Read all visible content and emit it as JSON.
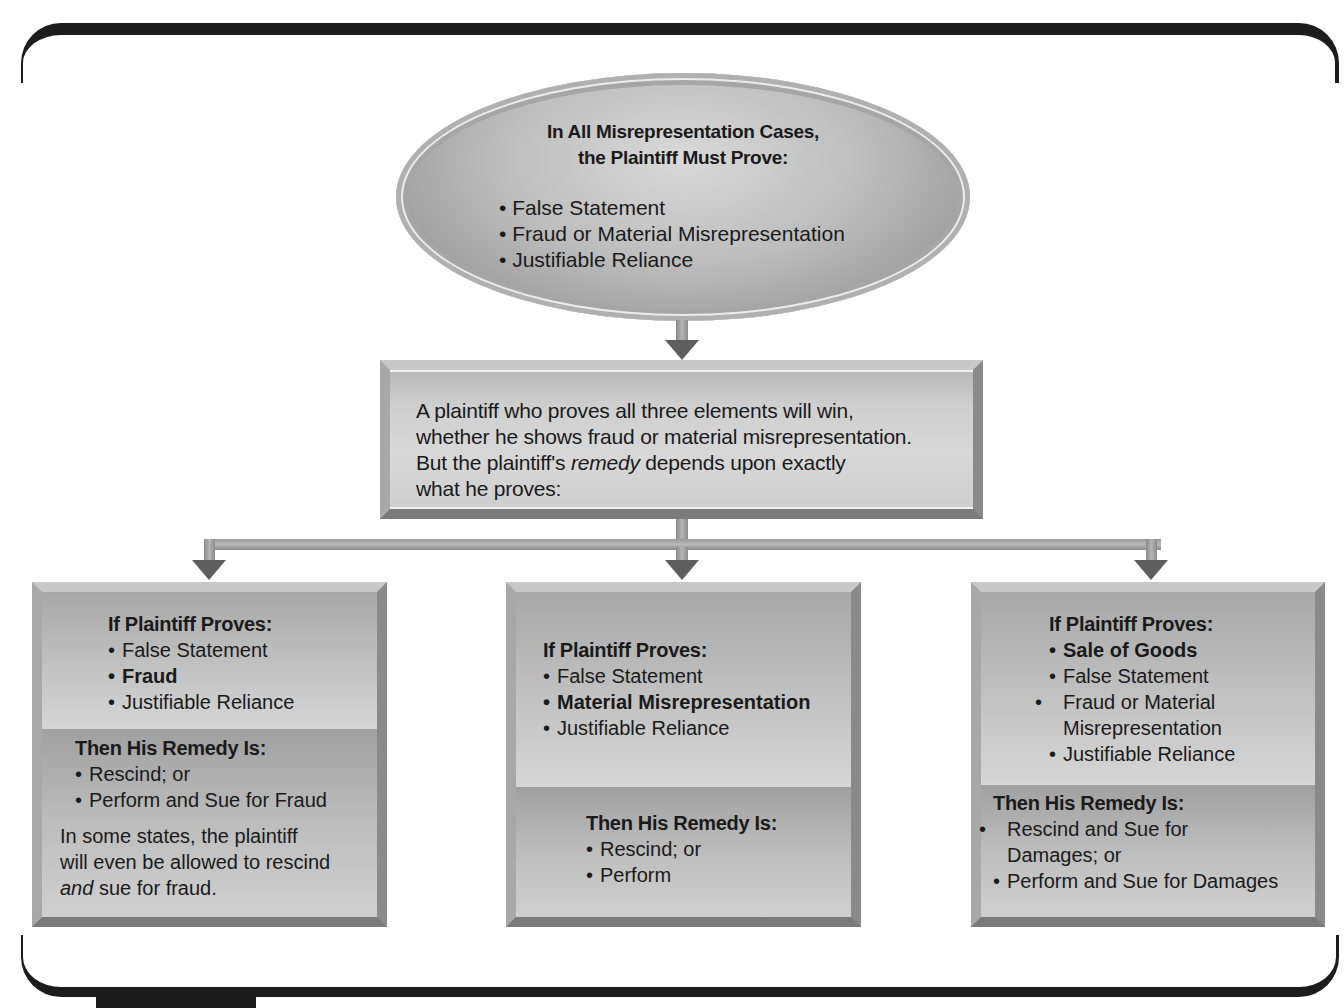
{
  "top_ellipse": {
    "title_line1": "In All Misrepresentation Cases,",
    "title_line2": "the Plaintiff Must Prove:",
    "items": [
      "False Statement",
      "Fraud or Material Misrepresentation",
      "Justifiable Reliance"
    ]
  },
  "middle_box": {
    "line1": "A plaintiff who proves all three elements will win,",
    "line2": "whether he shows fraud or material misrepresentation.",
    "line3_before": "But the plaintiff's ",
    "line3_italic": "remedy",
    "line3_after": " depends upon exactly",
    "line4": "what he proves:"
  },
  "branches": [
    {
      "proves_header": "If Plaintiff Proves:",
      "proves_items": [
        {
          "text": "False Statement",
          "bold": false
        },
        {
          "text": "Fraud",
          "bold": true
        },
        {
          "text": "Justifiable Reliance",
          "bold": false
        }
      ],
      "remedy_header": "Then His Remedy Is:",
      "remedy_items": [
        "Rescind; or",
        "Perform and Sue for Fraud"
      ],
      "note_line1": "In some states, the plaintiff",
      "note_line2": "will even be allowed to rescind",
      "note_italic": "and",
      "note_after": " sue for fraud."
    },
    {
      "proves_header": "If Plaintiff Proves:",
      "proves_items": [
        {
          "text": "False Statement",
          "bold": false
        },
        {
          "text": "Material Misrepresentation",
          "bold": true
        },
        {
          "text": "Justifiable Reliance",
          "bold": false
        }
      ],
      "remedy_header": "Then His Remedy Is:",
      "remedy_items": [
        "Rescind; or",
        "Perform"
      ]
    },
    {
      "proves_header": "If Plaintiff Proves:",
      "proves_items": [
        {
          "text": "Sale of Goods",
          "bold": true
        },
        {
          "text": "False Statement",
          "bold": false
        },
        {
          "text": "Fraud or Material Misrepresentation",
          "bold": false
        },
        {
          "text": "Justifiable Reliance",
          "bold": false
        }
      ],
      "remedy_header": "Then His Remedy Is:",
      "remedy_items": [
        "Rescind and Sue for Damages; or",
        "Perform and Sue for Damages"
      ]
    }
  ],
  "colors": {
    "frame": "#1c1c1c",
    "arrow": "#5e5e5e",
    "box_fill": "#c4c4c4",
    "text": "#1a1a1a"
  }
}
